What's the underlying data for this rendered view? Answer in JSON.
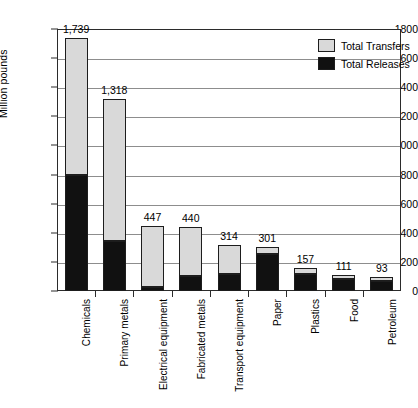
{
  "chart_data": {
    "type": "bar",
    "subtype": "stacked-vertical",
    "title": "",
    "xlabel": "",
    "ylabel": "Million pounds",
    "ylim": [
      0,
      1800
    ],
    "ytick_step": 200,
    "ytick_labels": [
      "0",
      "200",
      "400",
      "600",
      "800",
      "1000",
      "1200",
      "1400",
      "1600",
      "1800"
    ],
    "grid": true,
    "legend_position": "top-right",
    "categories": [
      "Chemicals",
      "Primary metals",
      "Electrical equipment",
      "Fabricated metals",
      "Transport equipment",
      "Paper",
      "Plastics",
      "Food",
      "Petroleum"
    ],
    "series": [
      {
        "name": "Total Releases",
        "color": "#111111",
        "values": [
          795,
          343,
          30,
          100,
          118,
          254,
          118,
          85,
          72
        ]
      },
      {
        "name": "Total Transfers",
        "color": "#d9d9d9",
        "values": [
          944,
          975,
          417,
          340,
          196,
          47,
          39,
          26,
          21
        ]
      }
    ],
    "totals": [
      1739,
      1318,
      447,
      440,
      314,
      301,
      157,
      111,
      93
    ],
    "total_labels": [
      "1,739",
      "1,318",
      "447",
      "440",
      "314",
      "301",
      "157",
      "111",
      "93"
    ]
  },
  "legend": {
    "items": [
      {
        "label": "Total Transfers",
        "color": "#d9d9d9"
      },
      {
        "label": "Total Releases",
        "color": "#111111"
      }
    ]
  }
}
